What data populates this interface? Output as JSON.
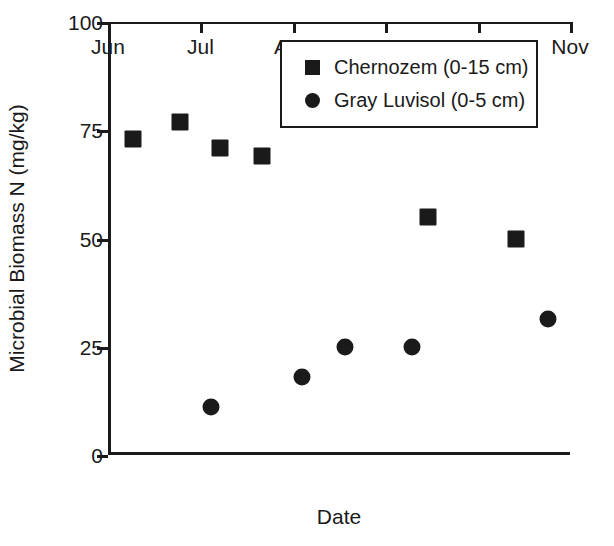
{
  "chart_data": {
    "type": "scatter",
    "title": "",
    "xlabel": "Date",
    "ylabel": "Microbial Biomass N (mg/kg)",
    "ylim": [
      0,
      100
    ],
    "yticks": [
      0,
      25,
      50,
      75,
      100
    ],
    "ytick_labels": [
      "0",
      "25",
      "50",
      "75",
      "100"
    ],
    "xlim": [
      "Jun",
      "Nov"
    ],
    "xtick_labels": [
      "Jun",
      "Jul",
      "Aug",
      "Sep",
      "Oct",
      "Nov"
    ],
    "grid": false,
    "legend_position": "top-right",
    "series": [
      {
        "name": "Chernozem (0-15 cm)",
        "marker": "square",
        "color": "#1a1a1a",
        "points": [
          {
            "x": "Jun 8",
            "x_frac": 0.054,
            "y": 73
          },
          {
            "x": "Jun 23",
            "x_frac": 0.156,
            "y": 77
          },
          {
            "x": "Jul 9",
            "x_frac": 0.242,
            "y": 71
          },
          {
            "x": "Jul 24",
            "x_frac": 0.333,
            "y": 69
          },
          {
            "x": "Sep 12",
            "x_frac": 0.693,
            "y": 55
          },
          {
            "x": "Oct 12",
            "x_frac": 0.883,
            "y": 50
          }
        ]
      },
      {
        "name": "Gray Luvisol (0-5 cm)",
        "marker": "circle",
        "color": "#1a1a1a",
        "points": [
          {
            "x": "Jul 12",
            "x_frac": 0.223,
            "y": 11
          },
          {
            "x": "Aug 6",
            "x_frac": 0.42,
            "y": 18
          },
          {
            "x": "Aug 20",
            "x_frac": 0.513,
            "y": 25
          },
          {
            "x": "Sep 10",
            "x_frac": 0.658,
            "y": 25
          },
          {
            "x": "Oct 25",
            "x_frac": 0.952,
            "y": 31.5
          }
        ]
      }
    ]
  },
  "axis": {
    "y_title": "Microbial Biomass N (mg/kg)",
    "x_title": "Date"
  },
  "legend": {
    "entries": [
      {
        "label": "Chernozem (0-15 cm)",
        "marker": "square"
      },
      {
        "label": "Gray Luvisol (0-5 cm)",
        "marker": "circle"
      }
    ]
  }
}
